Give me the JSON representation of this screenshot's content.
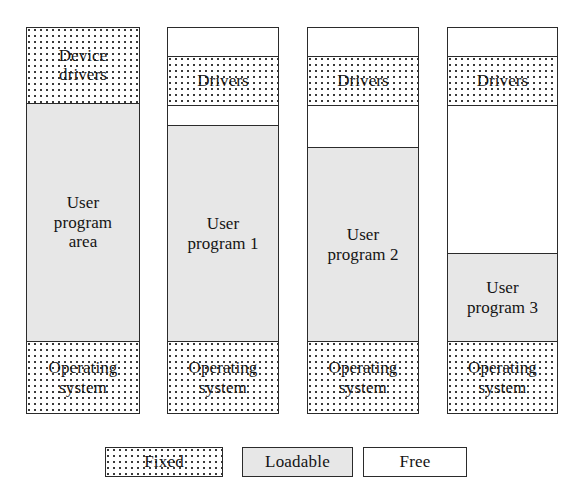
{
  "figure": {
    "kind": "memory-layout-diagram",
    "columns": [
      {
        "id": "col-1",
        "segments": [
          {
            "label": "Device\ndrivers",
            "fill": "fixed",
            "top_pct": 0.0,
            "height_pct": 19.4
          },
          {
            "label": "User\nprogram\narea",
            "fill": "loadable",
            "top_pct": 19.4,
            "height_pct": 62.0
          },
          {
            "label": "Operating\nsystem",
            "fill": "fixed",
            "top_pct": 81.4,
            "height_pct": 18.6
          }
        ]
      },
      {
        "id": "col-2",
        "segments": [
          {
            "label": "",
            "fill": "free",
            "top_pct": 0.0,
            "height_pct": 7.2
          },
          {
            "label": "Drivers",
            "fill": "fixed",
            "top_pct": 7.2,
            "height_pct": 12.7
          },
          {
            "label": "",
            "fill": "free",
            "top_pct": 19.9,
            "height_pct": 5.2
          },
          {
            "label": "User\nprogram 1",
            "fill": "loadable",
            "top_pct": 25.1,
            "height_pct": 56.3
          },
          {
            "label": "Operating\nsystem",
            "fill": "fixed",
            "top_pct": 81.4,
            "height_pct": 18.6
          }
        ]
      },
      {
        "id": "col-3",
        "segments": [
          {
            "label": "",
            "fill": "free",
            "top_pct": 0.0,
            "height_pct": 7.2
          },
          {
            "label": "Drivers",
            "fill": "fixed",
            "top_pct": 7.2,
            "height_pct": 12.7
          },
          {
            "label": "",
            "fill": "free",
            "top_pct": 19.9,
            "height_pct": 11.1
          },
          {
            "label": "User\nprogram 2",
            "fill": "loadable",
            "top_pct": 31.0,
            "height_pct": 50.4
          },
          {
            "label": "Operating\nsystem",
            "fill": "fixed",
            "top_pct": 81.4,
            "height_pct": 18.6
          }
        ]
      },
      {
        "id": "col-4",
        "segments": [
          {
            "label": "",
            "fill": "free",
            "top_pct": 0.0,
            "height_pct": 7.2
          },
          {
            "label": "Drivers",
            "fill": "fixed",
            "top_pct": 7.2,
            "height_pct": 12.7
          },
          {
            "label": "",
            "fill": "free",
            "top_pct": 19.9,
            "height_pct": 38.5
          },
          {
            "label": "User\nprogram 3",
            "fill": "loadable",
            "top_pct": 58.4,
            "height_pct": 23.0
          },
          {
            "label": "Operating\nsystem",
            "fill": "fixed",
            "top_pct": 81.4,
            "height_pct": 18.6
          }
        ]
      }
    ]
  },
  "legend": {
    "fixed": "Fixed",
    "loadable": "Loadable",
    "free": "Free"
  },
  "colors": {
    "outline": "#2b2b2b",
    "loadable_fill": "#e7e7e7",
    "free_fill": "#ffffff",
    "fixed_dot": "#3a3a3a",
    "text": "#141414"
  }
}
